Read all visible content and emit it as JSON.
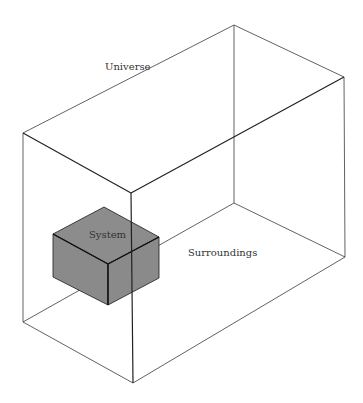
{
  "diagram": {
    "labels": {
      "universe": "Universe",
      "system": "System",
      "surroundings": "Surroundings"
    },
    "colors": {
      "background": "#ffffff",
      "universe_edge": "#3a3a3a",
      "system_fill": "#8c8c8c",
      "system_edge": "#1a1a1a",
      "text": "#333333"
    }
  }
}
